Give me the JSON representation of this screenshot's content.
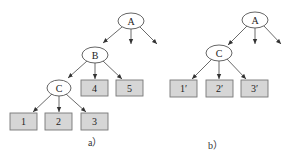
{
  "colors": {
    "box_fill": "#d6d6d6",
    "box_stroke": "#777777",
    "edge": "#444444",
    "node_fill": "#ffffff"
  },
  "diagram_a": {
    "caption": "a）",
    "nodes": {
      "A": {
        "label": "A"
      },
      "B": {
        "label": "B"
      },
      "C": {
        "label": "C"
      }
    },
    "leaves": [
      {
        "label": "1"
      },
      {
        "label": "2"
      },
      {
        "label": "3"
      },
      {
        "label": "4"
      },
      {
        "label": "5"
      }
    ]
  },
  "diagram_b": {
    "caption": "b）",
    "nodes": {
      "A": {
        "label": "A"
      },
      "C": {
        "label": "C"
      }
    },
    "leaves": [
      {
        "label": "1′"
      },
      {
        "label": "2′"
      },
      {
        "label": "3′"
      }
    ]
  }
}
